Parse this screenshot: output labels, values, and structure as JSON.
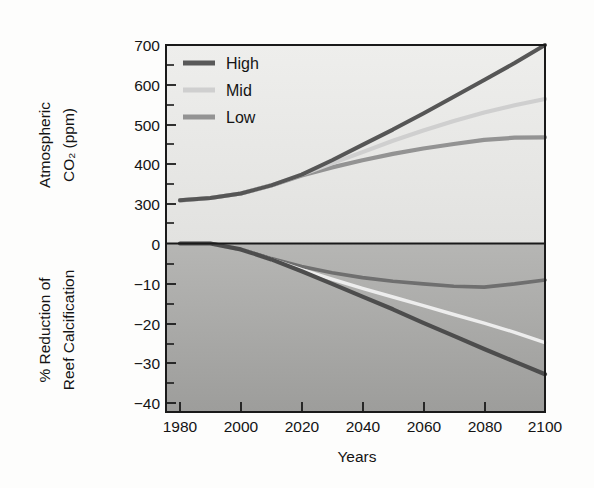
{
  "chart_data": {
    "type": "line",
    "title": "",
    "subtitle": "",
    "xlabel": "Years",
    "panels": [
      {
        "id": "co2",
        "ylabel_line1": "Atmospheric",
        "ylabel_line2": "CO₂ (ppm)",
        "ylabel": "Atmospheric CO2 (ppm)",
        "ylim": [
          260,
          700
        ],
        "yticks": [
          300,
          400,
          500,
          600,
          700
        ],
        "ytick_labels": [
          "300",
          "400",
          "500",
          "600",
          "700"
        ],
        "baseline_label": "0",
        "minor_ticks": [
          350,
          450,
          550,
          650
        ],
        "x": [
          1980,
          1990,
          2000,
          2010,
          2020,
          2030,
          2040,
          2050,
          2060,
          2070,
          2080,
          2090,
          2100
        ],
        "series": [
          {
            "name": "High",
            "color": "#595959",
            "values": [
              355,
              360,
              370,
              388,
              412,
              444,
              478,
              512,
              548,
              585,
              622,
              660,
              700
            ]
          },
          {
            "name": "Mid",
            "color": "#c9c9c9",
            "values": [
              355,
              360,
              370,
              388,
              412,
              437,
              462,
              487,
              510,
              531,
              550,
              566,
              580
            ]
          },
          {
            "name": "Low",
            "color": "#939393",
            "values": [
              355,
              360,
              370,
              388,
              410,
              428,
              444,
              458,
              470,
              480,
              489,
              494,
              495
            ]
          }
        ]
      },
      {
        "id": "calcification",
        "ylabel_line1": "% Reduction of",
        "ylabel_line2": "Reef Calcification",
        "ylabel": "% Reduction of Reef Calcification",
        "ylim": [
          -43,
          1
        ],
        "yticks": [
          0,
          -10,
          -20,
          -30,
          -40
        ],
        "ytick_labels": [
          "0",
          "−10",
          "−20",
          "−30",
          "−40"
        ],
        "minor_ticks": [
          -5,
          -15,
          -25,
          -35
        ],
        "x": [
          1980,
          1990,
          2000,
          2010,
          2020,
          2030,
          2040,
          2050,
          2060,
          2070,
          2080,
          2090,
          2100
        ],
        "series": [
          {
            "name": "High",
            "color": "#4f4f4f",
            "values": [
              0,
              0,
              -1.5,
              -4.0,
              -7.0,
              -10.2,
              -13.4,
              -16.6,
              -20.0,
              -23.3,
              -26.6,
              -29.8,
              -33.0
            ]
          },
          {
            "name": "Mid",
            "color": "#ededed",
            "values": [
              0,
              0,
              -1.5,
              -4.0,
              -6.6,
              -9.0,
              -11.3,
              -13.5,
              -15.7,
              -17.9,
              -20.1,
              -22.4,
              -25.0
            ]
          },
          {
            "name": "Low",
            "color": "#6f6f6f",
            "values": [
              0,
              0,
              -1.5,
              -3.8,
              -5.8,
              -7.4,
              -8.6,
              -9.5,
              -10.2,
              -10.8,
              -11.0,
              -10.2,
              -9.2
            ]
          }
        ]
      }
    ],
    "xticks": [
      1980,
      2000,
      2020,
      2040,
      2060,
      2080,
      2100
    ],
    "xtick_labels": [
      "1980",
      "2000",
      "2020",
      "2040",
      "2060",
      "2080",
      "2100"
    ],
    "xlim": [
      1970,
      2100
    ],
    "grid": false,
    "legend": {
      "position": "top-left",
      "entries": [
        {
          "label": "High",
          "color": "#595959"
        },
        {
          "label": "Mid",
          "color": "#c9c9c9"
        },
        {
          "label": "Low",
          "color": "#939393"
        }
      ]
    },
    "background": {
      "top_panel_fill": "#e9e9e7",
      "bottom_panel_fill_top": "#b4b4b2",
      "bottom_panel_fill_bottom": "#a0a09e",
      "frame_color": "#1a1a1a"
    }
  }
}
